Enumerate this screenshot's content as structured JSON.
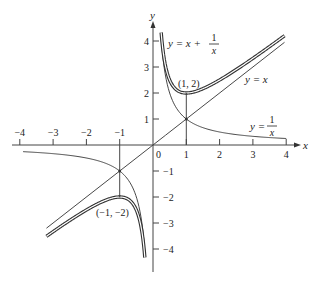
{
  "diagram": {
    "type": "function-plot",
    "x_axis": {
      "label": "x",
      "ticks": [
        -4,
        -3,
        -2,
        -1,
        1,
        2,
        3,
        4
      ],
      "tick_labels": [
        "−4",
        "−3",
        "−2",
        "−1",
        "1",
        "2",
        "3",
        "4"
      ]
    },
    "y_axis": {
      "label": "y",
      "ticks": [
        4,
        3,
        2,
        1,
        -1,
        -2,
        -3,
        -4
      ],
      "tick_labels": [
        "4",
        "3",
        "2",
        "1",
        "−1",
        "−2",
        "−3",
        "−4"
      ]
    },
    "origin_label": "0",
    "curves": [
      {
        "name": "y = x + 1/x",
        "style": "double",
        "label_main": "y = x + ",
        "label_num": "1",
        "label_den": "x"
      },
      {
        "name": "y = x",
        "style": "thin",
        "label": "y = x"
      },
      {
        "name": "y = 1/x",
        "style": "thin",
        "label_main": "y = ",
        "label_num": "1",
        "label_den": "x"
      }
    ],
    "points": [
      {
        "label": "(1, 2)",
        "x": 1,
        "y": 2
      },
      {
        "label": "(−1, −2)",
        "x": -1,
        "y": -2
      }
    ],
    "colors": {
      "curve": "#333333",
      "axis": "#444444",
      "double_gap": "#ffffff"
    }
  }
}
